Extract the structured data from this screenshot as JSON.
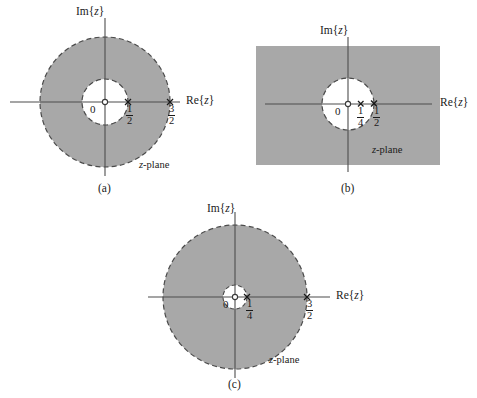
{
  "figure": {
    "axis_labels": {
      "real": "Re{z}",
      "imag": "Im{z}",
      "real_prefix": "Re{",
      "imag_prefix": "Im{",
      "var": "z",
      "suffix": "}"
    },
    "plane_label_var": "z",
    "plane_label_rest": "-plane",
    "origin_label": "0",
    "colors": {
      "shade": "#a8a8a8",
      "axis": "#4d4d4d",
      "boundary": "#4a4a4a",
      "text": "#1a1a1a",
      "background": "#ffffff"
    },
    "panels": [
      {
        "id": "a",
        "caption": "(a)",
        "region_type": "annulus",
        "center": {
          "x": 105,
          "y": 102
        },
        "inner_radius_px": 23,
        "outer_radius_px": 65,
        "inner_radius_value": {
          "num": "1",
          "den": "2"
        },
        "outer_radius_value": {
          "num": "3",
          "den": "2"
        },
        "markers": [
          {
            "label_num": "1",
            "label_den": "2",
            "value": 0.5,
            "type": "pole-x"
          },
          {
            "label_num": "3",
            "label_den": "2",
            "value": 1.5,
            "type": "pole-x"
          }
        ],
        "origin_marker": "open-circle",
        "plane_label": "z-plane"
      },
      {
        "id": "b",
        "caption": "(b)",
        "region_type": "exterior-disc",
        "center": {
          "x": 348,
          "y": 104
        },
        "inner_radius_px": 26,
        "rect": {
          "x": 256,
          "y": 46,
          "width": 184,
          "height": 119
        },
        "inner_radius_value": {
          "num": "1",
          "den": "2"
        },
        "markers": [
          {
            "label_num": "1",
            "label_den": "4",
            "value": 0.25,
            "type": "pole-x"
          },
          {
            "label_num": "1",
            "label_den": "2",
            "value": 0.5,
            "type": "pole-dot"
          }
        ],
        "origin_marker": "open-circle",
        "plane_label": "z-plane"
      },
      {
        "id": "c",
        "caption": "(c)",
        "region_type": "annulus",
        "center": {
          "x": 235,
          "y": 297
        },
        "inner_radius_px": 12,
        "outer_radius_px": 72,
        "inner_radius_value": {
          "num": "1",
          "den": "4"
        },
        "outer_radius_value": {
          "num": "3",
          "den": "2"
        },
        "markers": [
          {
            "label_num": "1",
            "label_den": "4",
            "value": 0.25,
            "type": "pole-x"
          },
          {
            "label_num": "3",
            "label_den": "2",
            "value": 1.5,
            "type": "pole-x"
          }
        ],
        "origin_marker": "open-circle",
        "plane_label": "z-plane"
      }
    ]
  }
}
